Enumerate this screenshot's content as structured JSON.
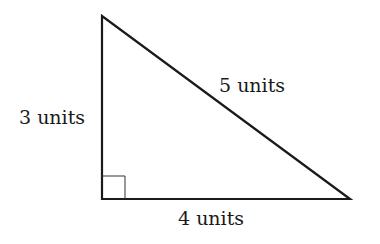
{
  "diagram": {
    "type": "right-triangle",
    "vertices": {
      "top": [
        102,
        16
      ],
      "bottom_left": [
        102,
        199
      ],
      "bottom_right": [
        350,
        199
      ]
    },
    "right_angle_at": "bottom_left",
    "labels": {
      "vertical_side": "3 units",
      "hypotenuse": "5 units",
      "horizontal_side": "4 units"
    },
    "colors": {
      "stroke": "#1a1a1a",
      "background": "#ffffff"
    }
  }
}
